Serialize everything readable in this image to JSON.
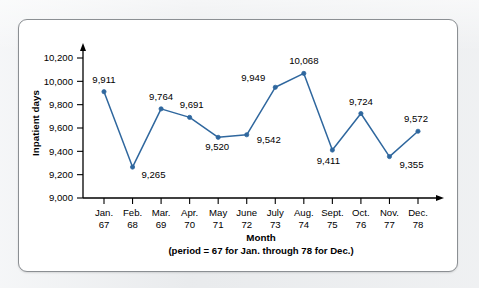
{
  "chart_data": {
    "type": "line",
    "title": "",
    "xlabel": "Month",
    "xlabel_note": "(period = 67 for Jan. through 78 for Dec.)",
    "ylabel": "Inpatient days",
    "categories": [
      "Jan.",
      "Feb.",
      "Mar.",
      "Apr.",
      "May",
      "June",
      "July",
      "Aug.",
      "Sept.",
      "Oct.",
      "Nov.",
      "Dec."
    ],
    "periods": [
      "67",
      "68",
      "69",
      "70",
      "71",
      "72",
      "73",
      "74",
      "75",
      "76",
      "77",
      "78"
    ],
    "values": [
      9911,
      9265,
      9764,
      9691,
      9520,
      9542,
      9949,
      10068,
      9411,
      9724,
      9355,
      9572
    ],
    "value_labels": [
      "9,911",
      "9,265",
      "9,764",
      "9,691",
      "9,520",
      "9,542",
      "9,949",
      "10,068",
      "9,411",
      "9,724",
      "9,355",
      "9,572"
    ],
    "ytick_labels": [
      "9,000",
      "9,200",
      "9,400",
      "9,600",
      "9,800",
      "10,000",
      "10,200"
    ],
    "ytick_values": [
      9000,
      9200,
      9400,
      9600,
      9800,
      10000,
      10200
    ],
    "ylim": [
      9000,
      10200
    ],
    "grid": false,
    "legend": "none",
    "series_color": "#2f679e",
    "marker": "circle",
    "label_offsets": [
      {
        "dx": 0,
        "dy": -9,
        "anchor": "middle"
      },
      {
        "dx": 9,
        "dy": 11,
        "anchor": "start"
      },
      {
        "dx": 0,
        "dy": -9,
        "anchor": "middle"
      },
      {
        "dx": 2,
        "dy": -9,
        "anchor": "middle"
      },
      {
        "dx": -1,
        "dy": 13,
        "anchor": "middle"
      },
      {
        "dx": 10,
        "dy": 8,
        "anchor": "start"
      },
      {
        "dx": -10,
        "dy": -6,
        "anchor": "end"
      },
      {
        "dx": 0,
        "dy": -9,
        "anchor": "middle"
      },
      {
        "dx": -4,
        "dy": 14,
        "anchor": "middle"
      },
      {
        "dx": 0,
        "dy": -9,
        "anchor": "middle"
      },
      {
        "dx": 10,
        "dy": 11,
        "anchor": "start"
      },
      {
        "dx": -2,
        "dy": -9,
        "anchor": "middle"
      }
    ]
  },
  "colors": {
    "page_background": "#e9ebed",
    "panel_background": "#ffffff",
    "panel_border": "#8b8f93",
    "axis": "#000000",
    "series": "#2f679e"
  }
}
